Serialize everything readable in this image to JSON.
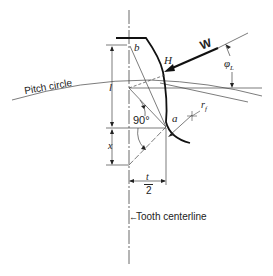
{
  "figure": {
    "labels": {
      "pitch_circle": "Pitch circle",
      "tooth_centerline": "Tooth centerline",
      "load": "W",
      "point_b": "b",
      "point_h": "H",
      "point_a": "a",
      "height_l": "l",
      "length_x": "x",
      "angle_right": "90°",
      "load_angle": "φ",
      "load_angle_sub": "L",
      "fillet_radius": "r",
      "fillet_radius_sub": "f",
      "half_thickness_num": "t",
      "half_thickness_den": "2"
    },
    "colors": {
      "ink": "#222222",
      "thin_line": "#444444",
      "background": "#ffffff"
    }
  }
}
